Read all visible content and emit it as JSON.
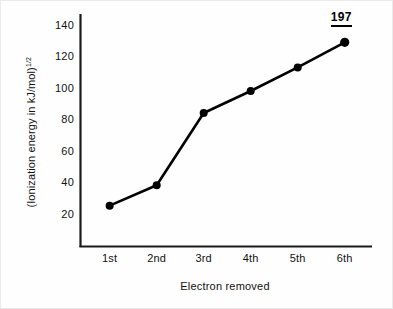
{
  "chart_data": {
    "type": "line",
    "title": "",
    "xlabel": "Electron removed",
    "ylabel": "(Ionization energy in kJ/mol)",
    "ylabel_exponent": "1/2",
    "categories": [
      "1st",
      "2nd",
      "3rd",
      "4th",
      "5th",
      "6th"
    ],
    "values": [
      26,
      39,
      85,
      99,
      114,
      130
    ],
    "series": [
      {
        "name": "(Ionization energy in kJ/mol)^1/2",
        "values": [
          26,
          39,
          85,
          99,
          114,
          130
        ]
      }
    ],
    "yticks": [
      20,
      40,
      60,
      80,
      100,
      120,
      140
    ],
    "ylim": [
      0,
      148
    ],
    "grid": false,
    "legend": false,
    "legend_position": "none",
    "marker": "filled-circle",
    "line_color": "#000000",
    "marker_color": "#000000",
    "background_color": "#ffffff",
    "annotations": [
      {
        "text": "197",
        "category": "6th",
        "style": "bold-underlined",
        "position": "above-last-point"
      }
    ]
  },
  "axes": {
    "y_tick_labels": [
      "140",
      "120",
      "100",
      "80",
      "60",
      "40",
      "20"
    ],
    "x_tick_labels": [
      "1st",
      "2nd",
      "3rd",
      "4th",
      "5th",
      "6th"
    ]
  },
  "annotation": {
    "value_label": "197"
  }
}
